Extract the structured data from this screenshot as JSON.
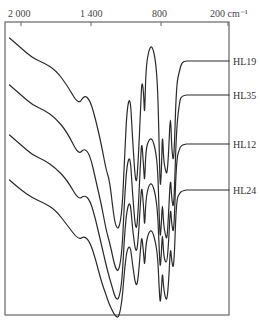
{
  "chart_data": {
    "type": "line",
    "title": "",
    "xlabel": "cm⁻¹",
    "ylabel": "",
    "x_reversed": true,
    "xlim": [
      2100,
      180
    ],
    "x_ticks": [
      2000,
      1400,
      800,
      200
    ],
    "x_tick_labels": [
      "2 000",
      "1 400",
      "800",
      "200 cm⁻¹"
    ],
    "grid": false,
    "legend_position": "right, inline labels",
    "series": [
      {
        "name": "HL19",
        "label_y": 61,
        "points": [
          [
            2100,
            38
          ],
          [
            2000,
            48
          ],
          [
            1900,
            58
          ],
          [
            1800,
            63
          ],
          [
            1700,
            70
          ],
          [
            1600,
            85
          ],
          [
            1500,
            105
          ],
          [
            1450,
            95
          ],
          [
            1400,
            100
          ],
          [
            1350,
            120
          ],
          [
            1300,
            145
          ],
          [
            1260,
            170
          ],
          [
            1230,
            180
          ],
          [
            1200,
            210
          ],
          [
            1180,
            225
          ],
          [
            1150,
            230
          ],
          [
            1120,
            210
          ],
          [
            1100,
            160
          ],
          [
            1080,
            110
          ],
          [
            1050,
            95
          ],
          [
            1030,
            140
          ],
          [
            1000,
            190
          ],
          [
            980,
            160
          ],
          [
            960,
            110
          ],
          [
            950,
            80
          ],
          [
            935,
            90
          ],
          [
            925,
            120
          ],
          [
            915,
            70
          ],
          [
            890,
            50
          ],
          [
            860,
            45
          ],
          [
            830,
            60
          ],
          [
            810,
            90
          ],
          [
            800,
            140
          ],
          [
            790,
            190
          ],
          [
            780,
            175
          ],
          [
            770,
            130
          ],
          [
            760,
            160
          ],
          [
            745,
            170
          ],
          [
            730,
            175
          ],
          [
            715,
            150
          ],
          [
            700,
            110
          ],
          [
            690,
            150
          ],
          [
            670,
            165
          ],
          [
            650,
            85
          ],
          [
            620,
            70
          ],
          [
            600,
            62
          ],
          [
            560,
            61
          ]
        ]
      },
      {
        "name": "HL35",
        "label_y": 95,
        "points": [
          [
            2100,
            85
          ],
          [
            2000,
            95
          ],
          [
            1900,
            105
          ],
          [
            1800,
            110
          ],
          [
            1700,
            118
          ],
          [
            1600,
            132
          ],
          [
            1500,
            155
          ],
          [
            1450,
            148
          ],
          [
            1400,
            155
          ],
          [
            1350,
            180
          ],
          [
            1300,
            205
          ],
          [
            1260,
            230
          ],
          [
            1230,
            242
          ],
          [
            1200,
            258
          ],
          [
            1180,
            268
          ],
          [
            1150,
            272
          ],
          [
            1120,
            250
          ],
          [
            1100,
            200
          ],
          [
            1080,
            165
          ],
          [
            1050,
            155
          ],
          [
            1030,
            195
          ],
          [
            1000,
            235
          ],
          [
            980,
            210
          ],
          [
            960,
            160
          ],
          [
            950,
            140
          ],
          [
            935,
            165
          ],
          [
            925,
            185
          ],
          [
            915,
            150
          ],
          [
            890,
            140
          ],
          [
            860,
            138
          ],
          [
            830,
            150
          ],
          [
            810,
            170
          ],
          [
            800,
            210
          ],
          [
            790,
            240
          ],
          [
            780,
            225
          ],
          [
            770,
            200
          ],
          [
            760,
            225
          ],
          [
            745,
            235
          ],
          [
            730,
            240
          ],
          [
            715,
            210
          ],
          [
            700,
            175
          ],
          [
            690,
            200
          ],
          [
            670,
            210
          ],
          [
            650,
            130
          ],
          [
            620,
            100
          ],
          [
            600,
            96
          ],
          [
            560,
            95
          ]
        ]
      },
      {
        "name": "HL12",
        "label_y": 144,
        "points": [
          [
            2100,
            135
          ],
          [
            2000,
            145
          ],
          [
            1900,
            155
          ],
          [
            1800,
            160
          ],
          [
            1700,
            168
          ],
          [
            1600,
            180
          ],
          [
            1500,
            200
          ],
          [
            1450,
            195
          ],
          [
            1400,
            200
          ],
          [
            1350,
            220
          ],
          [
            1300,
            245
          ],
          [
            1260,
            265
          ],
          [
            1230,
            278
          ],
          [
            1200,
            290
          ],
          [
            1180,
            298
          ],
          [
            1150,
            300
          ],
          [
            1120,
            280
          ],
          [
            1100,
            235
          ],
          [
            1080,
            210
          ],
          [
            1050,
            200
          ],
          [
            1030,
            230
          ],
          [
            1000,
            255
          ],
          [
            980,
            240
          ],
          [
            960,
            200
          ],
          [
            950,
            185
          ],
          [
            935,
            205
          ],
          [
            925,
            230
          ],
          [
            915,
            200
          ],
          [
            890,
            185
          ],
          [
            860,
            183
          ],
          [
            830,
            195
          ],
          [
            810,
            215
          ],
          [
            800,
            245
          ],
          [
            790,
            270
          ],
          [
            780,
            255
          ],
          [
            770,
            230
          ],
          [
            760,
            255
          ],
          [
            745,
            262
          ],
          [
            730,
            262
          ],
          [
            715,
            240
          ],
          [
            700,
            205
          ],
          [
            690,
            225
          ],
          [
            670,
            235
          ],
          [
            650,
            160
          ],
          [
            620,
            148
          ],
          [
            600,
            145
          ],
          [
            560,
            144
          ]
        ]
      },
      {
        "name": "HL24",
        "label_y": 190,
        "points": [
          [
            2100,
            180
          ],
          [
            2000,
            190
          ],
          [
            1900,
            198
          ],
          [
            1800,
            203
          ],
          [
            1700,
            210
          ],
          [
            1600,
            225
          ],
          [
            1500,
            240
          ],
          [
            1450,
            236
          ],
          [
            1400,
            242
          ],
          [
            1350,
            260
          ],
          [
            1300,
            282
          ],
          [
            1260,
            295
          ],
          [
            1230,
            305
          ],
          [
            1200,
            312
          ],
          [
            1180,
            316
          ],
          [
            1150,
            318
          ],
          [
            1120,
            300
          ],
          [
            1100,
            270
          ],
          [
            1080,
            250
          ],
          [
            1050,
            245
          ],
          [
            1030,
            265
          ],
          [
            1000,
            288
          ],
          [
            980,
            278
          ],
          [
            960,
            248
          ],
          [
            950,
            235
          ],
          [
            935,
            252
          ],
          [
            925,
            268
          ],
          [
            915,
            245
          ],
          [
            890,
            232
          ],
          [
            860,
            230
          ],
          [
            830,
            242
          ],
          [
            810,
            258
          ],
          [
            800,
            285
          ],
          [
            790,
            305
          ],
          [
            780,
            292
          ],
          [
            770,
            270
          ],
          [
            760,
            288
          ],
          [
            745,
            298
          ],
          [
            730,
            300
          ],
          [
            715,
            280
          ],
          [
            700,
            245
          ],
          [
            690,
            262
          ],
          [
            670,
            270
          ],
          [
            650,
            200
          ],
          [
            620,
            193
          ],
          [
            600,
            191
          ],
          [
            560,
            190
          ]
        ]
      }
    ]
  },
  "axis": {
    "tick_labels": [
      "2 000",
      "1 400",
      "800",
      "200 cm⁻¹"
    ]
  },
  "labels": {
    "hl19": "HL19",
    "hl35": "HL35",
    "hl12": "HL12",
    "hl24": "HL24"
  }
}
